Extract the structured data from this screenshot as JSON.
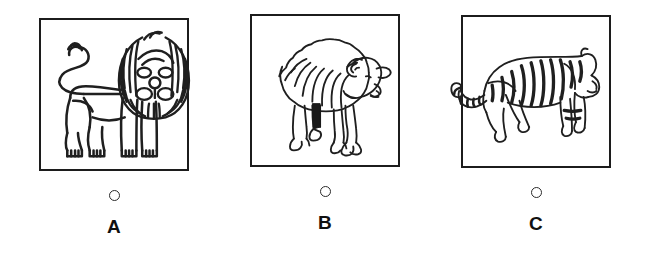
{
  "question": {
    "type": "multiple-choice-image",
    "option_count": 3
  },
  "options": [
    {
      "letter": "A",
      "selected": false,
      "image": {
        "name": "lion-illustration",
        "subject": "lion",
        "description": "Stylized heraldic lion standing in profile facing left, head turned forward with a large radiating striped mane, curled S-shaped tail with tufted tip",
        "style": "black line art on white",
        "line_color": "#1f1f1f"
      }
    },
    {
      "letter": "B",
      "selected": false,
      "image": {
        "name": "sheep-illustration",
        "subject": "sheep",
        "description": "Woolly sheep or ram standing in profile facing right, fleecy scalloped body outline, curled horn, one dark shaded foreleg",
        "style": "black line art on white",
        "line_color": "#1f1f1f"
      }
    },
    {
      "letter": "C",
      "selected": false,
      "image": {
        "name": "tiger-illustration",
        "subject": "tiger",
        "description": "Striped tiger walking in profile facing right, long banded tail curving down and to the left past the frame edge",
        "style": "black line art on white",
        "line_color": "#1f1f1f"
      }
    }
  ],
  "colors": {
    "background": "#ffffff",
    "frame_border": "#1c1c1c",
    "line_art": "#1f1f1f",
    "radio_border": "#2b2b2b",
    "letter": "#101010"
  },
  "icons": {
    "radio": "radio-button-unselected"
  }
}
